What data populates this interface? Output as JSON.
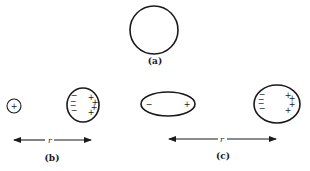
{
  "panels": {
    "a": {
      "label": "(a)",
      "description": "uncharged spherical conductor"
    },
    "b": {
      "label": "(b)",
      "point_charge_sign": "+",
      "induced_negative": [
        "−",
        "−",
        "−",
        "−"
      ],
      "induced_positive": [
        "+",
        "+",
        "+",
        "+"
      ],
      "distance_label": "r"
    },
    "c": {
      "label": "(c)",
      "dipole_negative": "−",
      "dipole_positive": "+",
      "induced_negative": [
        "−",
        "−",
        "−",
        "−"
      ],
      "induced_positive": [
        "+",
        "+",
        "+",
        "+"
      ],
      "distance_label": "r"
    }
  },
  "colors": {
    "ink": "#1a1a1a",
    "background": "#ffffff"
  }
}
